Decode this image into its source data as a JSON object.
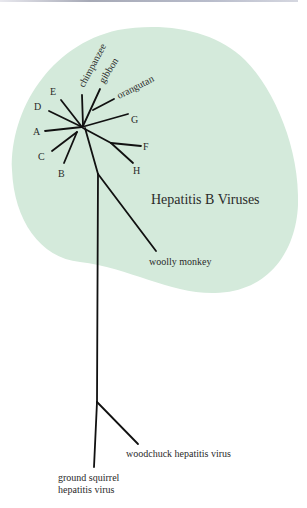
{
  "figure": {
    "colors": {
      "blob_fill": "#d4eadb",
      "branch": "#111111",
      "text": "#2a2a2a"
    },
    "group_label": "Hepatitis B Viruses",
    "leaves": {
      "chimpanzee": "chimpanzee",
      "gibbon": "gibbon",
      "orangutan": "orangutan",
      "E": "E",
      "D": "D",
      "A": "A",
      "C": "C",
      "B": "B",
      "G": "G",
      "F": "F",
      "H": "H",
      "woolly_monkey": "woolly monkey",
      "woodchuck": "woodchuck hepatitis virus",
      "ground_squirrel_line1": "ground squirrel",
      "ground_squirrel_line2": "hepatitis virus"
    }
  }
}
